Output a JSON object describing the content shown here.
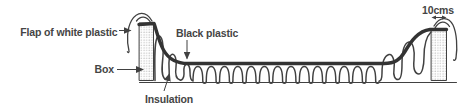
{
  "diagram": {
    "labels": {
      "flap": "Flap of white plastic",
      "black_plastic": "Black plastic",
      "box": "Box",
      "insulation": "Insulation",
      "dimension": "10cms"
    },
    "colors": {
      "line": "#414141",
      "plastic": "#333333",
      "text": "#454545",
      "stipple": "#9a9a9a",
      "background": "#ffffff"
    }
  }
}
